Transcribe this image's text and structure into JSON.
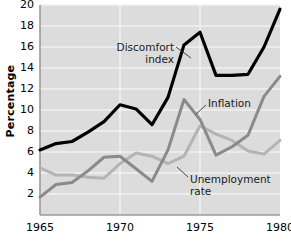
{
  "chart_data": {
    "type": "line",
    "title": "",
    "xlabel": "",
    "ylabel": "Percentage",
    "xlim": [
      1965,
      1980
    ],
    "ylim": [
      0,
      20
    ],
    "grid": true,
    "grid_axis": "y",
    "legend": "inline-annotations",
    "x": [
      1965,
      1966,
      1967,
      1968,
      1969,
      1970,
      1971,
      1972,
      1973,
      1974,
      1975,
      1976,
      1977,
      1978,
      1979,
      1980
    ],
    "xticks": [
      "1965",
      "1970",
      "1975",
      "1980"
    ],
    "xtick_values": [
      1965,
      1970,
      1975,
      1980
    ],
    "yticks": [
      "2",
      "4",
      "6",
      "8",
      "10",
      "12",
      "14",
      "16",
      "18",
      "20"
    ],
    "ytick_values": [
      2,
      4,
      6,
      8,
      10,
      12,
      14,
      16,
      18,
      20
    ],
    "series": [
      {
        "name": "Discomfort index",
        "color": "#000000",
        "width": 3.2,
        "values": [
          6.2,
          6.8,
          7.0,
          7.9,
          8.9,
          10.5,
          10.1,
          8.6,
          11.2,
          16.2,
          17.4,
          13.3,
          13.3,
          13.4,
          16.0,
          19.6
        ]
      },
      {
        "name": "Inflation",
        "color": "#8a8a8a",
        "width": 3.0,
        "values": [
          1.7,
          2.9,
          3.1,
          4.2,
          5.5,
          5.6,
          4.4,
          3.2,
          6.2,
          11.0,
          9.1,
          5.7,
          6.5,
          7.6,
          11.3,
          13.2
        ]
      },
      {
        "name": "Unemployment rate",
        "color": "#b4b4b4",
        "width": 3.0,
        "values": [
          4.5,
          3.8,
          3.8,
          3.6,
          3.5,
          4.9,
          5.9,
          5.6,
          4.9,
          5.6,
          8.5,
          7.7,
          7.1,
          6.1,
          5.8,
          7.1
        ]
      }
    ],
    "annotations": [
      {
        "name": "discomfort-index",
        "text_line1": "Discomfort",
        "text_line2": "index"
      },
      {
        "name": "inflation",
        "text_line1": "Inflation",
        "text_line2": ""
      },
      {
        "name": "unemployment-rate",
        "text_line1": "Unemployment",
        "text_line2": "rate"
      }
    ],
    "colors": {
      "plot_background": "#dcdcdc",
      "gridline": "#f2f2f2",
      "axis": "#9a9a9a",
      "discomfort": "#000000",
      "inflation": "#8a8a8a",
      "unemployment": "#b4b4b4",
      "text": "#000000"
    }
  },
  "axes": {
    "y_title": "Percentage"
  }
}
